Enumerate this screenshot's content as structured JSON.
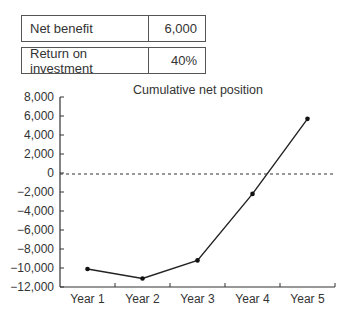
{
  "summary_table": [
    {
      "label": "Net benefit",
      "value": "6,000"
    },
    {
      "label": "Return on investment",
      "value": "40%"
    }
  ],
  "chart_data": {
    "type": "line",
    "title": "Cumulative net position",
    "xlabel": "",
    "ylabel": "",
    "categories": [
      "Year 1",
      "Year 2",
      "Year 3",
      "Year 4",
      "Year 5"
    ],
    "series": [
      {
        "name": "Cumulative net position",
        "values": [
          -10100,
          -11100,
          -9200,
          -2200,
          5700
        ]
      }
    ],
    "ylim": [
      -12000,
      8000
    ],
    "yticks": [
      8000,
      6000,
      4000,
      2000,
      0,
      -2000,
      -4000,
      -6000,
      -8000,
      -10000,
      -12000
    ],
    "ytick_labels": [
      "8,000",
      "6,000",
      "4,000",
      "2,000",
      "0",
      "−2,000",
      "−4,000",
      "−6,000",
      "−8,000",
      "−10,000",
      "−12,000"
    ],
    "reference_line": {
      "y": 0,
      "style": "dashed"
    },
    "grid": false,
    "legend": null
  }
}
